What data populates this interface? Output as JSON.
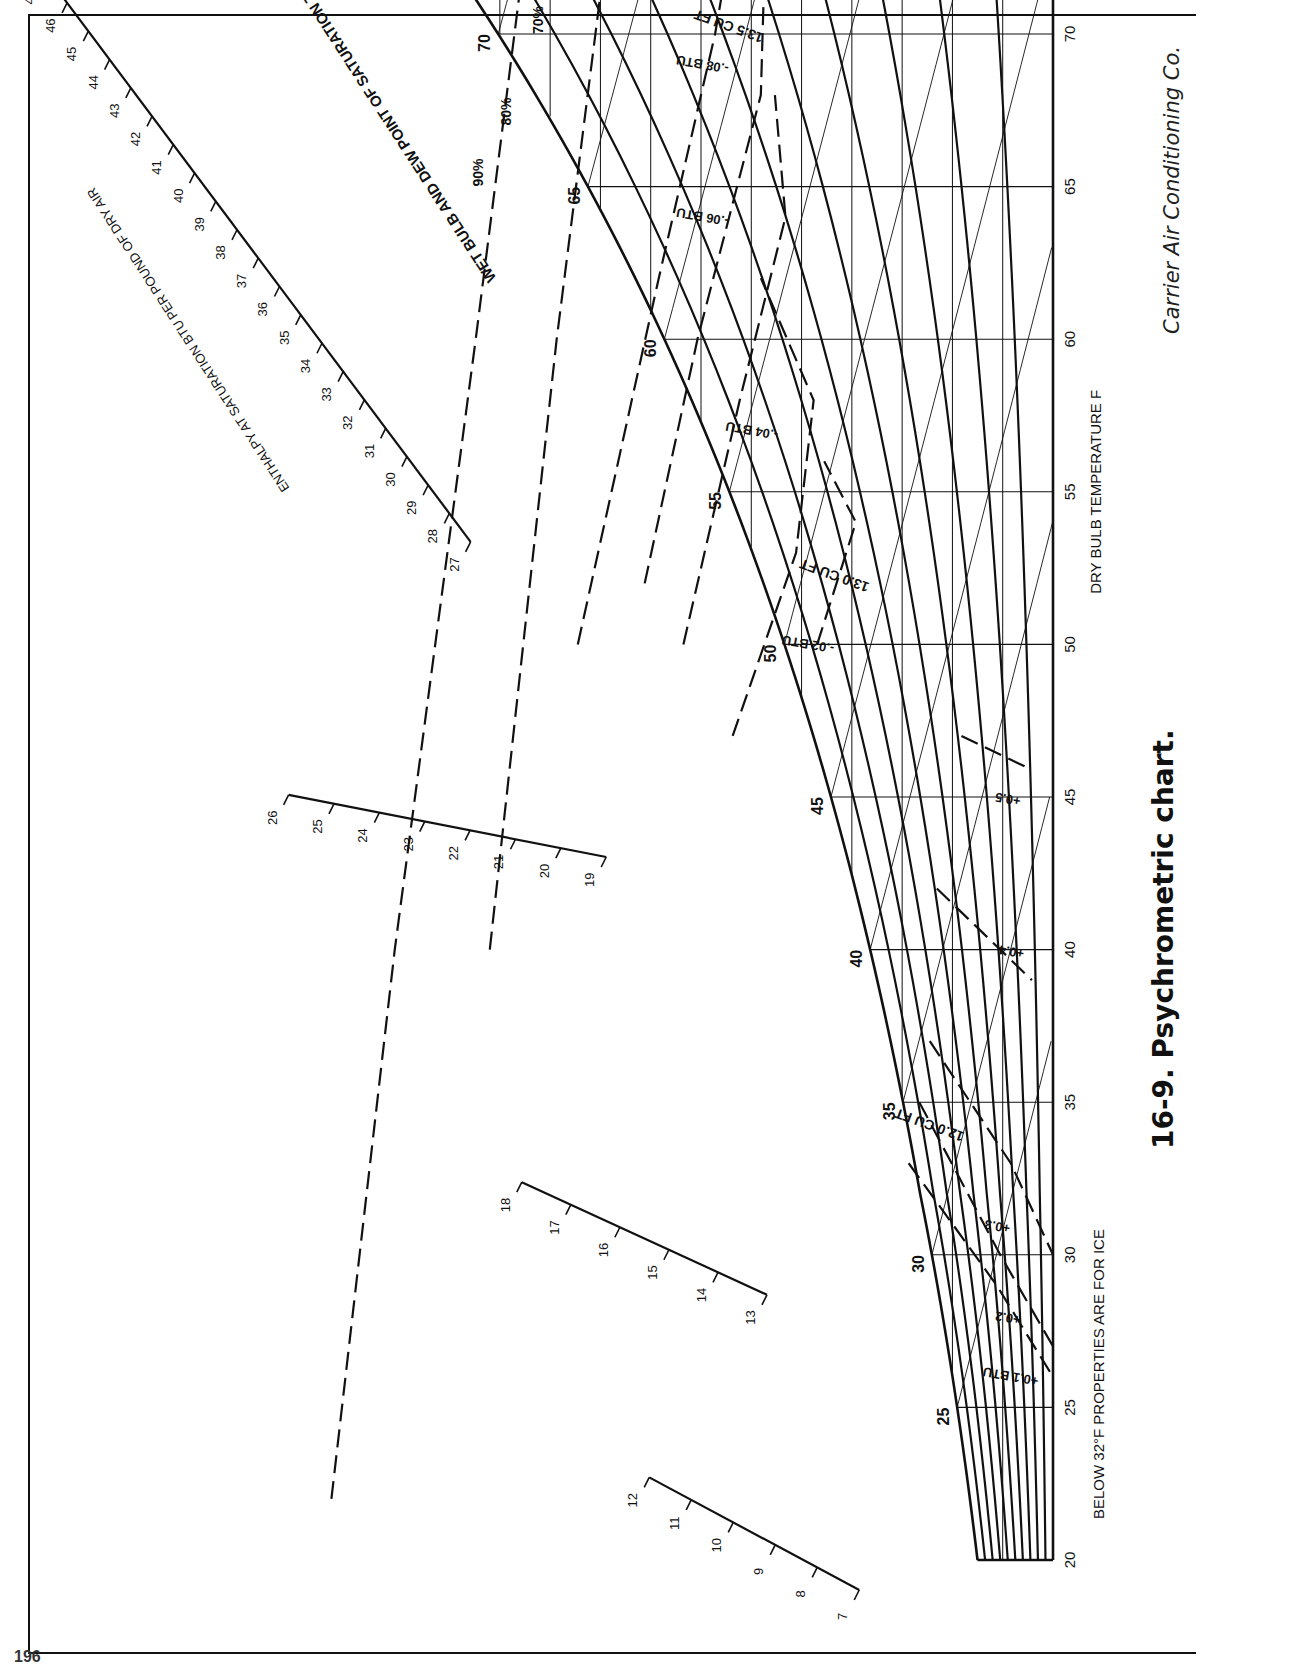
{
  "figure": {
    "caption": "16-9. Psychrometric chart.",
    "credit": "Carrier Air Conditioning Co.",
    "note": "BELOW 32°F PROPERTIES ARE FOR ICE",
    "page_number": "196"
  },
  "axes": {
    "dry_bulb_label": "DRY BULB TEMPERATURE F",
    "humidity_ratio_label": "POUNDS OF WATER PER POUND OF DRY AIR",
    "grains_label": "GRAINS OF MOISTURE PER POUND OF DRY AIR",
    "shf_label": "SENSIBLE HEAT FACTOR",
    "saturation_label": "WET BULB AND DEW POINT OF SATURATION TEMPERATURES",
    "enthalpy_label_1": "ENTHALPY AT SATURATION",
    "enthalpy_label_2": "BTU PER POUND OF DRY AIR",
    "rh_label": "40% RELATIVE HUMIDITY",
    "wb_label": "WET BULB TEMPERATURES",
    "enthalpy_dev_label": "-0.2 ENTHALPY DEVIATION",
    "enthalpy_dev_sub": "BTU PER LB OF DRY AIR",
    "volume_label": "14.5 CU FT PER LB OF DRY AIR"
  },
  "chart_data": {
    "type": "psychrometric",
    "title": "Psychrometric chart",
    "xlabel": "DRY BULB TEMPERATURE F",
    "ylabel": "POUNDS OF WATER PER POUND OF DRY AIR",
    "x_ticks": [
      20,
      25,
      30,
      35,
      40,
      45,
      50,
      55,
      60,
      65,
      70,
      75,
      80,
      85,
      90,
      95,
      100,
      105,
      110
    ],
    "xlim": [
      20,
      110
    ],
    "y_ticks": [
      0,
      0.001,
      0.002,
      0.003,
      0.004,
      0.005,
      0.006,
      0.007,
      0.008,
      0.009,
      0.01,
      0.011,
      0.012,
      0.013,
      0.014,
      0.015,
      0.016,
      0.017,
      0.018,
      0.019,
      0.02,
      0.021,
      0.022,
      0.023,
      0.024,
      0.025,
      0.026
    ],
    "ylim": [
      0,
      0.026
    ],
    "grains_ticks": [
      0,
      10,
      20,
      30,
      40,
      50,
      60,
      70,
      80,
      90,
      100,
      110,
      120,
      130,
      140,
      150,
      160,
      170,
      180
    ],
    "sensible_heat_factor_ticks": [
      ".35",
      ".40",
      ".45",
      ".50",
      ".55",
      ".60",
      ".65",
      ".70",
      ".75",
      ".80",
      ".85",
      ".90",
      ".95",
      "1.00"
    ],
    "saturation_temperature_labels": [
      25,
      30,
      35,
      40,
      45,
      50,
      55,
      60,
      65,
      70,
      75,
      80,
      85
    ],
    "relative_humidity_curves": [
      "10%",
      "20%",
      "30%",
      "40%",
      "50%",
      "60%",
      "70%",
      "80%",
      "90%"
    ],
    "specific_volume_lines": [
      "12.0 CU FT",
      "13.0 CU FT",
      "13.5 CU FT",
      "14.0 CU FT",
      "14.5 CU FT PER LB OF DRY AIR"
    ],
    "enthalpy_deviation_curves": [
      "+0.1 BTU",
      "+0.2",
      "+0.3",
      "+0.4",
      "+0.5",
      "-.02 BTU",
      "-.04 BTU",
      "-.06 BTU",
      "-.08 BTU",
      "-0.1 BTU",
      "-0.2 ENTHALPY DEVIATION BTU PER LB OF DRY AIR",
      "-0.3 BTU"
    ],
    "enthalpy_at_saturation_scales": [
      {
        "from": 7,
        "to": 12
      },
      {
        "from": 13,
        "to": 18
      },
      {
        "from": 19,
        "to": 26
      },
      {
        "from": 27,
        "to": 49
      }
    ],
    "grid": true,
    "legend": "none"
  },
  "colors": {
    "ink": "#111111",
    "paper": "#ffffff"
  }
}
